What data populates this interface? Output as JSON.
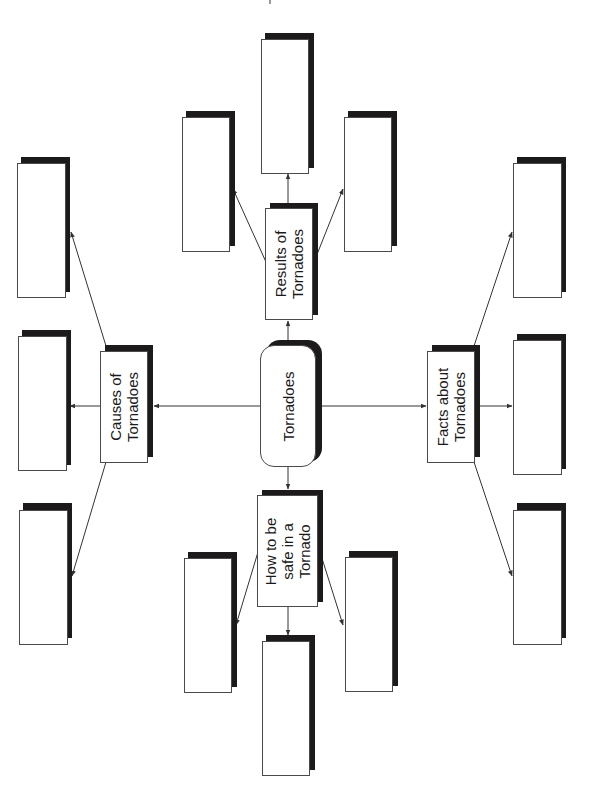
{
  "diagram": {
    "type": "web-organizer",
    "orientation": "rotated-90-ccw",
    "colors": {
      "border": "#4a4a4a",
      "shadow": "#1c1a1a",
      "background": "#ffffff",
      "line": "#333333"
    },
    "center": {
      "id": "center",
      "label": "Tornadoes"
    },
    "branches": [
      {
        "id": "results",
        "label": "Results of\nTornadoes",
        "leaves": 3
      },
      {
        "id": "causes",
        "label": "Causes of\nTornadoes",
        "leaves": 3
      },
      {
        "id": "facts",
        "label": "Facts about\nTornadoes",
        "leaves": 3
      },
      {
        "id": "safety",
        "label": "How to be\nsafe in a\nTornado",
        "leaves": 3
      }
    ],
    "leaf_boxes": [
      {
        "id": "results-leaf-1",
        "label": ""
      },
      {
        "id": "results-leaf-2",
        "label": ""
      },
      {
        "id": "results-leaf-3",
        "label": ""
      },
      {
        "id": "causes-leaf-1",
        "label": ""
      },
      {
        "id": "causes-leaf-2",
        "label": ""
      },
      {
        "id": "causes-leaf-3",
        "label": ""
      },
      {
        "id": "facts-leaf-1",
        "label": ""
      },
      {
        "id": "facts-leaf-2",
        "label": ""
      },
      {
        "id": "facts-leaf-3",
        "label": ""
      },
      {
        "id": "safety-leaf-1",
        "label": ""
      },
      {
        "id": "safety-leaf-2",
        "label": ""
      },
      {
        "id": "safety-leaf-3",
        "label": ""
      }
    ]
  }
}
